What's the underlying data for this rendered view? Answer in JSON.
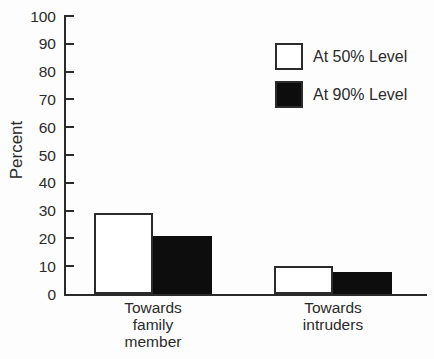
{
  "chart_data": {
    "type": "bar",
    "title": "",
    "ylabel": "Percent",
    "xlabel": "",
    "categories": [
      "Towards family member",
      "Towards intruders"
    ],
    "category_label_lines": [
      [
        "Towards",
        "family",
        "member"
      ],
      [
        "Towards",
        "intruders"
      ]
    ],
    "series": [
      {
        "name": "At 50% Level",
        "fill": "#ffffff",
        "values": [
          29,
          10
        ]
      },
      {
        "name": "At 90% Level",
        "fill": "#0d0d0d",
        "values": [
          21,
          8
        ]
      }
    ],
    "ylim": [
      0,
      100
    ],
    "ytick_interval": 10,
    "grid": false,
    "legend_position": "top-right",
    "axis_color": "#2b2b2b",
    "background_color": "#fdfdfd"
  }
}
